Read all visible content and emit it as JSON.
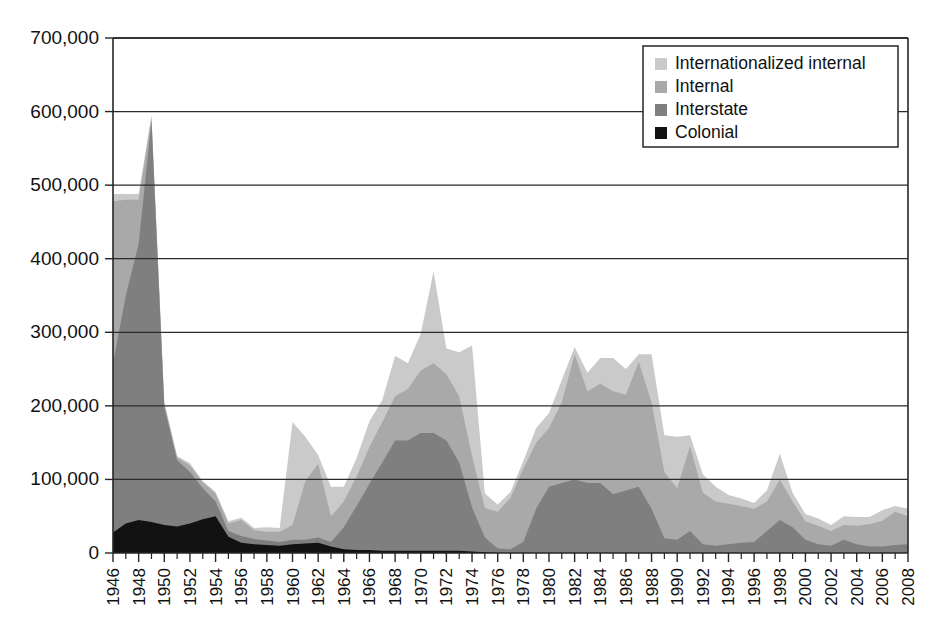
{
  "chart_data": {
    "type": "area",
    "stacked": true,
    "title": "",
    "subtitle": "",
    "xlabel": "",
    "ylabel": "",
    "xlim": [
      1946,
      2008
    ],
    "ylim": [
      0,
      700000
    ],
    "grid": true,
    "grid_axis": "y",
    "legend_position": "top-right",
    "y_tick_labels": [
      "0",
      "100,000",
      "200,000",
      "300,000",
      "400,000",
      "500,000",
      "600,000",
      "700,000"
    ],
    "y_ticks": [
      0,
      100000,
      200000,
      300000,
      400000,
      500000,
      600000,
      700000
    ],
    "x_tick_labels": [
      "1946",
      "1948",
      "1950",
      "1952",
      "1954",
      "1956",
      "1958",
      "1960",
      "1962",
      "1964",
      "1966",
      "1968",
      "1970",
      "1972",
      "1974",
      "1976",
      "1978",
      "1980",
      "1982",
      "1984",
      "1986",
      "1988",
      "1990",
      "1992",
      "1994",
      "1996",
      "1998",
      "2000",
      "2002",
      "2004",
      "2006",
      "2008"
    ],
    "x": [
      1946,
      1947,
      1948,
      1949,
      1950,
      1951,
      1952,
      1953,
      1954,
      1955,
      1956,
      1957,
      1958,
      1959,
      1960,
      1961,
      1962,
      1963,
      1964,
      1965,
      1966,
      1967,
      1968,
      1969,
      1970,
      1971,
      1972,
      1973,
      1974,
      1975,
      1976,
      1977,
      1978,
      1979,
      1980,
      1981,
      1982,
      1983,
      1984,
      1985,
      1986,
      1987,
      1988,
      1989,
      1990,
      1991,
      1992,
      1993,
      1994,
      1995,
      1996,
      1997,
      1998,
      1999,
      2000,
      2001,
      2002,
      2003,
      2004,
      2005,
      2006,
      2007,
      2008
    ],
    "series": [
      {
        "name": "Colonial",
        "color": "#121212",
        "values": [
          28000,
          40000,
          45000,
          42000,
          38000,
          36000,
          40000,
          46000,
          50000,
          22000,
          14000,
          12000,
          11000,
          10000,
          12000,
          13000,
          14000,
          9000,
          5000,
          4000,
          4000,
          3000,
          3000,
          3000,
          3000,
          3000,
          3000,
          3000,
          2000,
          1000,
          0,
          0,
          0,
          0,
          0,
          0,
          0,
          0,
          0,
          0,
          0,
          0,
          0,
          0,
          0,
          0,
          0,
          0,
          0,
          0,
          0,
          0,
          0,
          0,
          0,
          0,
          0,
          0,
          0,
          0,
          0,
          0,
          0
        ]
      },
      {
        "name": "Interstate",
        "color": "#7f7f7f",
        "values": [
          230000,
          310000,
          375000,
          545000,
          160000,
          90000,
          70000,
          42000,
          20000,
          8000,
          9000,
          7000,
          6000,
          5000,
          6000,
          5000,
          7000,
          6000,
          30000,
          60000,
          90000,
          120000,
          150000,
          150000,
          160000,
          160000,
          150000,
          120000,
          60000,
          20000,
          6000,
          5000,
          15000,
          60000,
          90000,
          95000,
          100000,
          95000,
          95000,
          80000,
          85000,
          90000,
          60000,
          20000,
          18000,
          30000,
          12000,
          10000,
          12000,
          14000,
          15000,
          30000,
          45000,
          35000,
          18000,
          12000,
          10000,
          18000,
          12000,
          9000,
          9000,
          11000,
          12000
        ]
      },
      {
        "name": "Internal",
        "color": "#a9a9a9",
        "values": [
          220000,
          130000,
          60000,
          5000,
          5000,
          4000,
          9000,
          8000,
          11000,
          10000,
          22000,
          12000,
          12000,
          14000,
          20000,
          80000,
          100000,
          35000,
          35000,
          40000,
          50000,
          55000,
          60000,
          70000,
          85000,
          95000,
          90000,
          90000,
          70000,
          40000,
          50000,
          70000,
          100000,
          90000,
          80000,
          110000,
          170000,
          125000,
          135000,
          140000,
          130000,
          170000,
          145000,
          90000,
          70000,
          115000,
          70000,
          60000,
          55000,
          50000,
          45000,
          40000,
          55000,
          35000,
          25000,
          25000,
          20000,
          20000,
          25000,
          30000,
          35000,
          45000,
          38000
        ]
      },
      {
        "name": "Internationalized internal",
        "color": "#cacaca",
        "values": [
          10000,
          8000,
          8000,
          3000,
          2000,
          2000,
          3000,
          2000,
          2000,
          3000,
          3000,
          3000,
          6000,
          5000,
          140000,
          60000,
          12000,
          40000,
          20000,
          25000,
          35000,
          30000,
          55000,
          35000,
          50000,
          125000,
          35000,
          60000,
          150000,
          20000,
          10000,
          8000,
          10000,
          20000,
          20000,
          30000,
          10000,
          25000,
          35000,
          45000,
          35000,
          10000,
          65000,
          50000,
          70000,
          15000,
          25000,
          20000,
          12000,
          10000,
          8000,
          15000,
          35000,
          12000,
          10000,
          10000,
          8000,
          12000,
          12000,
          10000,
          14000,
          8000,
          10000
        ]
      }
    ]
  },
  "legend": {
    "items": [
      {
        "label": "Internationalized internal",
        "color": "#cacaca"
      },
      {
        "label": "Internal",
        "color": "#a9a9a9"
      },
      {
        "label": "Interstate",
        "color": "#7f7f7f"
      },
      {
        "label": "Colonial",
        "color": "#121212"
      }
    ]
  },
  "axes": {
    "y_label_suffix": "",
    "x_step_years": 1,
    "x_label_step_years": 2
  }
}
